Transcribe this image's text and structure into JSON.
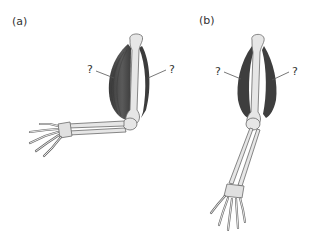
{
  "figure": {
    "panels": [
      {
        "label": "(a)",
        "pose": "arm bent at elbow, forearm horizontal",
        "muscles": [
          {
            "name": "front muscle (contracted)",
            "callout": "?"
          },
          {
            "name": "back muscle (relaxed)",
            "callout": "?"
          }
        ]
      },
      {
        "label": "(b)",
        "pose": "arm straight, hanging down",
        "muscles": [
          {
            "name": "front muscle",
            "callout": "?"
          },
          {
            "name": "back muscle",
            "callout": "?"
          }
        ]
      }
    ],
    "colors": {
      "muscle": "#4a4a4a",
      "bone_fill": "#e8e8e8",
      "bone_stroke": "#6a6a6a",
      "leader": "#555555",
      "background": "#ffffff"
    }
  }
}
